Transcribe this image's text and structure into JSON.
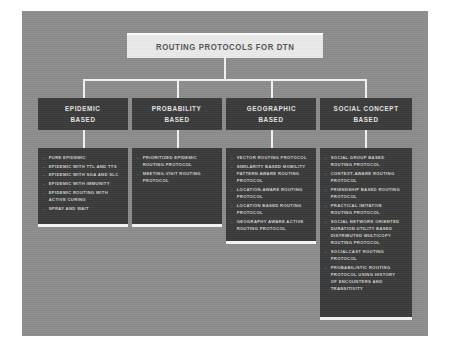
{
  "diagram": {
    "root": {
      "label": "ROUTING PROTOCOLS FOR DTN"
    },
    "categories": [
      {
        "id": "epidemic-based",
        "header_line1": "EPIDEMIC",
        "header_line2": "BASED",
        "items": [
          "PURE EPIDEMIC",
          "EPIDEMIC WITH TTL AND TTS",
          "EPIDEMIC WITH SGA AND SLC",
          "EPIDEMIC WITH IMMUNITY",
          "EPIDEMIC ROUTING WITH ACTIVE CURING",
          "SPRAY AND WAIT"
        ]
      },
      {
        "id": "probability-based",
        "header_line1": "PROBABILITY",
        "header_line2": "BASED",
        "items": [
          "PRIORITIZED EPIDEMIC ROUTING PROTOCOL",
          "MEETING-VISIT ROUTING PROTOCOL"
        ]
      },
      {
        "id": "geographic-based",
        "header_line1": "GEOGRAPHIC",
        "header_line2": "BASED",
        "items": [
          "VECTOR ROUTING PROTOCOL",
          "SIMILARITY BASED MOBILITY PATTERN AWARE ROUTING PROTOCOL",
          "LOCATION-AWARE ROUTING PROTOCOL",
          "LOCATION BASED ROUTING PROTOCOL",
          "GEOGRAPHY AWARE ACTIVE ROUTING PROTOCOL"
        ]
      },
      {
        "id": "social-concept-based",
        "header_line1": "SOCIAL CONCEPT",
        "header_line2": "BASED",
        "items": [
          "SOCIAL GROUP BASED ROUTING PROTOCOL",
          "CONTEXT-AWARE ROUTING PROTOCOL",
          "FRIENDSHIP BASED ROUTING PROTOCOL",
          "PRACTICAL IMITATIVE ROUTING PROTOCOL",
          "SOCIAL NETWORK ORIENTED DURATION UTILITY BASED DISTRIBUTED MULTICOPY ROUTING PROTOCOL",
          "SOCIALCAST ROUTING PROTOCOL",
          "PROBABILISTIC ROUTING PROTOCOL USING HISTORY OF ENCOUNTERS AND TRANSITIVITY"
        ]
      }
    ],
    "colors": {
      "canvas": "#8c8c8c",
      "node_fill": "#3a3a3a",
      "node_text": "#cfcfcf",
      "title_fill": "#e9e9e9",
      "title_text": "#555555",
      "connector": "#f2f2f2"
    }
  }
}
